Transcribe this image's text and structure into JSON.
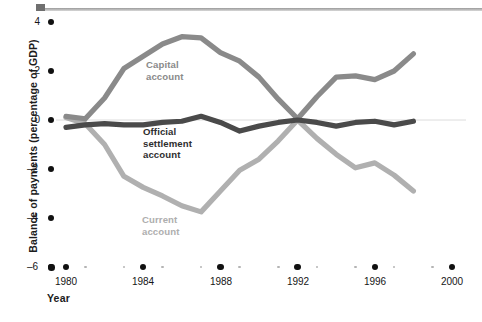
{
  "figure": {
    "top_rule": "horizontal-rule",
    "background_color": "#ffffff"
  },
  "axes": {
    "y_title": "Balance of payments (percentage of GDP)",
    "x_title": "Year",
    "y_ticks": [
      "4",
      "2",
      "0",
      "–2",
      "–4",
      "–6"
    ],
    "x_ticks": [
      "1980",
      "1984",
      "1988",
      "1992",
      "1996",
      "2000"
    ]
  },
  "labels": {
    "capital": "Capital\naccount",
    "capital_line1": "Capital",
    "capital_line2": "account",
    "official_line1": "Official",
    "official_line2": "settlement",
    "official_line3": "account",
    "current_line1": "Current",
    "current_line2": "account"
  },
  "colors": {
    "capital": "#8a8a8a",
    "official": "#4a4a4a",
    "current": "#b0b0b0",
    "zero_line": "#d9d9d9",
    "tick": "#111111",
    "minor_tick": "#b4b4b4",
    "text": "#161616"
  },
  "chart_data": {
    "type": "line",
    "title": "",
    "xlabel": "Year",
    "ylabel": "Balance of payments (percentage of GDP)",
    "xlim": [
      1980,
      2000
    ],
    "ylim": [
      -6,
      4
    ],
    "grid": false,
    "legend": "inline-labels",
    "x": [
      1980,
      1981,
      1982,
      1983,
      1984,
      1985,
      1986,
      1987,
      1988,
      1989,
      1990,
      1991,
      1992,
      1993,
      1994,
      1995,
      1996,
      1997,
      1998
    ],
    "series": [
      {
        "name": "Capital account",
        "color": "#8a8a8a",
        "values": [
          0.15,
          0.05,
          0.9,
          2.1,
          2.6,
          3.1,
          3.4,
          3.35,
          2.75,
          2.4,
          1.75,
          0.85,
          0.05,
          0.95,
          1.75,
          1.8,
          1.65,
          2.0,
          2.7
        ]
      },
      {
        "name": "Official settlement account",
        "color": "#4a4a4a",
        "values": [
          -0.3,
          -0.2,
          -0.15,
          -0.2,
          -0.2,
          -0.1,
          -0.05,
          0.15,
          -0.1,
          -0.45,
          -0.25,
          -0.1,
          0.0,
          -0.1,
          -0.25,
          -0.1,
          -0.05,
          -0.2,
          -0.05
        ]
      },
      {
        "name": "Current account",
        "color": "#b0b0b0",
        "values": [
          0.1,
          -0.15,
          -1.0,
          -2.3,
          -2.75,
          -3.1,
          -3.5,
          -3.75,
          -2.9,
          -2.05,
          -1.6,
          -0.85,
          0.0,
          -0.75,
          -1.4,
          -1.95,
          -1.75,
          -2.25,
          -2.9
        ]
      }
    ]
  }
}
